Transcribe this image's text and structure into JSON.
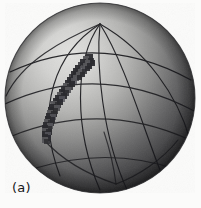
{
  "figure": {
    "panel_label": "(a)",
    "caption_text": "(a)",
    "background_color": "#fbfbfa"
  },
  "sphere": {
    "center_x": 100,
    "center_y": 98,
    "radius": 95,
    "outline_color": "#3a3a3d",
    "highlight_color": "#d8d8d6",
    "midtone_color": "#8f8f8e",
    "shadow_color": "#141416",
    "light_source": "upper-left",
    "highlight_offset_x": 62,
    "highlight_offset_y": 48
  },
  "grid": {
    "line_color": "#1d1d20",
    "line_width": 1.15,
    "north_pole_x": 100,
    "north_pole_y": 24,
    "south_pole_x": 116,
    "south_pole_y": 184,
    "meridian_count": 6,
    "parallel_count": 4,
    "meridian_label": "meridian",
    "parallel_label": "parallel"
  },
  "raster_arc": {
    "label": "rasterized-great-circle-arc",
    "fill_color": "#2b2b2e",
    "soft_color": "#55555a",
    "start_x": 92,
    "start_y": 57,
    "end_x": 44,
    "end_y": 143,
    "cell_size": 5,
    "cells": [
      [
        86,
        54,
        7,
        7
      ],
      [
        83,
        56,
        6,
        6
      ],
      [
        88,
        58,
        6,
        6
      ],
      [
        80,
        59,
        6,
        6
      ],
      [
        85,
        60,
        6,
        7
      ],
      [
        90,
        60,
        5,
        6
      ],
      [
        78,
        62,
        6,
        6
      ],
      [
        83,
        63,
        6,
        6
      ],
      [
        87,
        63,
        5,
        6
      ],
      [
        75,
        65,
        6,
        6
      ],
      [
        80,
        66,
        6,
        6
      ],
      [
        85,
        66,
        5,
        5
      ],
      [
        73,
        68,
        6,
        6
      ],
      [
        78,
        69,
        6,
        6
      ],
      [
        82,
        69,
        5,
        5
      ],
      [
        71,
        71,
        6,
        6
      ],
      [
        76,
        72,
        6,
        6
      ],
      [
        80,
        72,
        5,
        5
      ],
      [
        69,
        74,
        6,
        6
      ],
      [
        73,
        75,
        6,
        6
      ],
      [
        77,
        75,
        5,
        5
      ],
      [
        67,
        77,
        6,
        6
      ],
      [
        71,
        78,
        6,
        6
      ],
      [
        65,
        80,
        6,
        6
      ],
      [
        69,
        81,
        6,
        6
      ],
      [
        63,
        83,
        6,
        6
      ],
      [
        67,
        84,
        6,
        6
      ],
      [
        61,
        86,
        6,
        6
      ],
      [
        65,
        87,
        6,
        6
      ],
      [
        59,
        89,
        6,
        6
      ],
      [
        63,
        90,
        6,
        6
      ],
      [
        57,
        92,
        6,
        6
      ],
      [
        61,
        93,
        6,
        6
      ],
      [
        55,
        95,
        6,
        6
      ],
      [
        59,
        96,
        6,
        6
      ],
      [
        53,
        98,
        6,
        6
      ],
      [
        57,
        99,
        6,
        6
      ],
      [
        51,
        101,
        6,
        6
      ],
      [
        55,
        102,
        6,
        6
      ],
      [
        50,
        104,
        6,
        6
      ],
      [
        54,
        105,
        6,
        6
      ],
      [
        48,
        107,
        6,
        6
      ],
      [
        52,
        108,
        6,
        6
      ],
      [
        47,
        110,
        6,
        6
      ],
      [
        51,
        111,
        6,
        6
      ],
      [
        46,
        113,
        6,
        6
      ],
      [
        50,
        114,
        6,
        6
      ],
      [
        45,
        116,
        6,
        6
      ],
      [
        49,
        117,
        6,
        6
      ],
      [
        44,
        119,
        6,
        6
      ],
      [
        48,
        120,
        6,
        6
      ],
      [
        43,
        122,
        6,
        6
      ],
      [
        47,
        123,
        6,
        6
      ],
      [
        42,
        125,
        6,
        6
      ],
      [
        46,
        126,
        6,
        6
      ],
      [
        42,
        128,
        6,
        6
      ],
      [
        46,
        129,
        6,
        6
      ],
      [
        42,
        131,
        6,
        6
      ],
      [
        45,
        132,
        6,
        6
      ],
      [
        42,
        134,
        6,
        6
      ],
      [
        45,
        135,
        6,
        6
      ],
      [
        42,
        137,
        6,
        6
      ],
      [
        44,
        139,
        6,
        5
      ]
    ]
  }
}
